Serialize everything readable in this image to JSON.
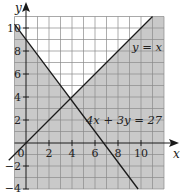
{
  "figure": {
    "type": "inequality-graph",
    "colors": {
      "shaded": "#c9c9c9",
      "unshaded": "#ffffff",
      "grid": "#8a8a8a",
      "line": "#1a1a1a",
      "axis": "#1a1a1a"
    },
    "axes": {
      "x_label": "x",
      "y_label": "y",
      "x_ticks": [
        {
          "value": 0,
          "label": "0"
        },
        {
          "value": 2,
          "label": "2"
        },
        {
          "value": 4,
          "label": "4"
        },
        {
          "value": 6,
          "label": "6"
        },
        {
          "value": 8,
          "label": "8"
        },
        {
          "value": 10,
          "label": "10"
        }
      ],
      "y_ticks": [
        {
          "value": 10,
          "label": "10"
        },
        {
          "value": 8,
          "label": "8"
        },
        {
          "value": 6,
          "label": "6"
        },
        {
          "value": 4,
          "label": "4"
        },
        {
          "value": 2,
          "label": "2"
        },
        {
          "value": -2,
          "label": "−2"
        },
        {
          "value": -4,
          "label": "−4"
        }
      ],
      "x_range": [
        -1,
        12
      ],
      "y_range": [
        -4,
        11
      ]
    },
    "lines": [
      {
        "id": "line-y-equals-x",
        "equation": "y = x",
        "label": "y = x"
      },
      {
        "id": "line-4x-3y-27",
        "equation": "4x + 3y = 27",
        "label": "4x + 3y = 27"
      }
    ],
    "unshaded_region": "y ≥ x and 4x + 3y ≥ 27",
    "intersection": {
      "x": 3.857,
      "y": 3.857
    }
  }
}
